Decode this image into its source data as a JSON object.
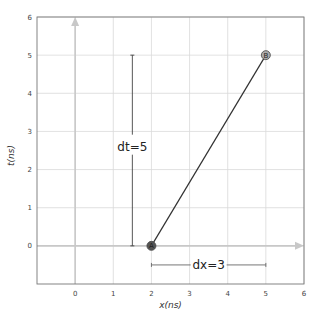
{
  "chart_data": {
    "type": "line",
    "title": "",
    "xlabel": "x(ns)",
    "ylabel": "t(ns)",
    "xlim": [
      -1,
      6
    ],
    "ylim": [
      -1,
      6
    ],
    "grid": true,
    "x_ticks": [
      0,
      1,
      2,
      3,
      4,
      5,
      6
    ],
    "y_ticks": [
      0,
      1,
      2,
      3,
      4,
      5,
      6
    ],
    "x_tick_labels": [
      "0",
      "1",
      "2",
      "3",
      "4",
      "5",
      "6"
    ],
    "y_tick_labels": [
      "0",
      "1",
      "2",
      "3",
      "4",
      "5",
      "6"
    ],
    "axes_arrows": {
      "x_axis": {
        "from": [
          -1,
          0
        ],
        "to": [
          6,
          0
        ]
      },
      "t_axis": {
        "from": [
          0,
          -1
        ],
        "to": [
          0,
          6
        ]
      }
    },
    "series": [
      {
        "name": "worldline",
        "x": [
          2,
          5
        ],
        "y": [
          0,
          5
        ]
      }
    ],
    "points": [
      {
        "label": "A",
        "x": 2,
        "y": 0,
        "style": "filled-dark"
      },
      {
        "label": "B",
        "x": 5,
        "y": 5,
        "style": "filled-light"
      }
    ],
    "annotations": [
      {
        "text": "dt=5",
        "type": "vertical-bracket",
        "x": 1.5,
        "y_from": 0,
        "y_to": 5,
        "label_y": 2.6
      },
      {
        "text": "dx=3",
        "type": "horizontal-bracket",
        "y": -0.5,
        "x_from": 2,
        "x_to": 5,
        "label_x": 3.5
      }
    ],
    "colors": {
      "grid": "#d9d9d9",
      "axis_arrow": "#c8c8c8",
      "line": "#333333",
      "frame": "#777777",
      "point_a": "#555555",
      "point_b": "#aaaaaa"
    }
  }
}
